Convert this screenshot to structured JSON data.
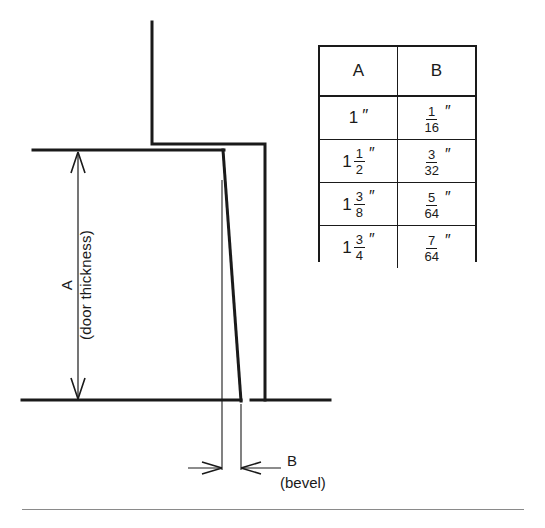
{
  "figure": {
    "ink_color": "#1a1a1a",
    "background_color": "#ffffff",
    "rule_color": "#8a8a8a"
  },
  "diagram": {
    "dimension_a": {
      "label": "A",
      "sublabel": "(door thickness)"
    },
    "dimension_b": {
      "label": "B",
      "sublabel": "(bevel)"
    }
  },
  "table": {
    "headers": [
      "A",
      "B"
    ],
    "rows": [
      {
        "a": {
          "whole": "1",
          "num": "",
          "den": "",
          "inch": "″"
        },
        "b": {
          "whole": "",
          "num": "1",
          "den": "16",
          "inch": "″"
        }
      },
      {
        "a": {
          "whole": "1",
          "num": "1",
          "den": "2",
          "inch": "″"
        },
        "b": {
          "whole": "",
          "num": "3",
          "den": "32",
          "inch": "″"
        }
      },
      {
        "a": {
          "whole": "1",
          "num": "3",
          "den": "8",
          "inch": "″"
        },
        "b": {
          "whole": "",
          "num": "5",
          "den": "64",
          "inch": "″"
        }
      },
      {
        "a": {
          "whole": "1",
          "num": "3",
          "den": "4",
          "inch": "″"
        },
        "b": {
          "whole": "",
          "num": "7",
          "den": "64",
          "inch": "″"
        }
      }
    ]
  }
}
